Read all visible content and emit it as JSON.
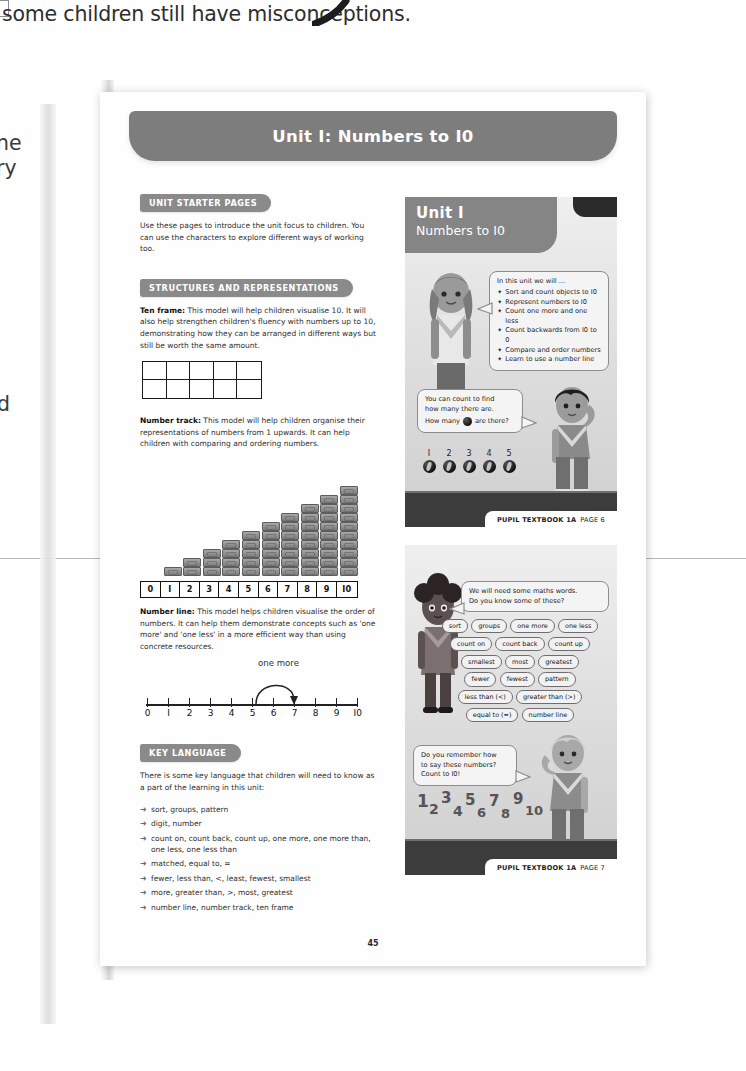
{
  "scan": {
    "facing_page_text": "some children still have misconceptions.",
    "left_margin_fragments": [
      "ne",
      "ry",
      "d"
    ]
  },
  "page": {
    "page_number": "45",
    "unit_banner_title": "Unit I: Numbers to I0"
  },
  "left_column": {
    "starter": {
      "heading": "UNIT STARTER PAGES",
      "body": "Use these pages to introduce the unit focus to children. You can use the characters to explore different ways of working too."
    },
    "structures": {
      "heading": "STRUCTURES AND REPRESENTATIONS",
      "ten_frame": {
        "label": "Ten frame:",
        "body": " This model will help children visualise 10. It will also help strengthen children's fluency with numbers up to 10, demonstrating how they can be arranged in different ways but still be worth the same amount.",
        "rows": 2,
        "cols": 5
      },
      "number_track": {
        "label": "Number track:",
        "body": " This model will help children organise their representations of numbers from 1 upwards. It can help children with comparing and ordering numbers.",
        "cells": [
          "0",
          "I",
          "2",
          "3",
          "4",
          "5",
          "6",
          "7",
          "8",
          "9",
          "I0"
        ],
        "stack_heights": [
          0,
          1,
          2,
          3,
          4,
          5,
          6,
          7,
          8,
          9,
          10
        ]
      },
      "number_line": {
        "label": "Number line:",
        "body": " This model helps children visualise the order of numbers. It can help them demonstrate concepts such as 'one more' and 'one less' in a more efficient way than using concrete resources.",
        "annotation": "one more",
        "ticks": [
          "0",
          "I",
          "2",
          "3",
          "4",
          "5",
          "6",
          "7",
          "8",
          "9",
          "I0"
        ],
        "arc_from": "6",
        "arc_to": "7"
      }
    },
    "key_language": {
      "heading": "KEY LANGUAGE",
      "intro": "There is some key language that children will need to know as a part of the learning in this unit:",
      "items": [
        "sort, groups, pattern",
        "digit, number",
        "count on, count back, count up, one more, one more than, one less, one less than",
        "matched, equal to, =",
        "fewer, less than, <, least, fewest, smallest",
        "more, greater than, >, most, greatest",
        "number line, number track, ten frame"
      ],
      "arrow_glyph": "➜"
    }
  },
  "right_column": {
    "page6": {
      "title_line1": "Unit I",
      "title_line2": "Numbers to I0",
      "bubble_intro": "In this unit we will ...",
      "bubble_items": [
        "Sort and count objects to I0",
        "Represent numbers to I0",
        "Count one more and one less",
        "Count backwards from I0 to 0",
        "Compare and order numbers",
        "Learn to use a number line"
      ],
      "bullet_glyph": "✦",
      "bubble2_line1": "You can count to find",
      "bubble2_line2": "how many there are.",
      "bubble2_line3_pre": "How many",
      "bubble2_line3_post": "are there?",
      "count_numbers": [
        "I",
        "2",
        "3",
        "4",
        "5"
      ],
      "footer_label": "PUPIL TEXTBOOK 1A",
      "footer_page": "PAGE 6"
    },
    "page7": {
      "bubble_line1": "We will need some maths words.",
      "bubble_line2": "Do you know some of these?",
      "tag_rows": [
        [
          "sort",
          "groups",
          "one more",
          "one less"
        ],
        [
          "count on",
          "count back",
          "count up"
        ],
        [
          "smallest",
          "most",
          "greatest"
        ],
        [
          "fewer",
          "fewest",
          "pattern"
        ],
        [
          "less than (<)",
          "greater than (>)"
        ],
        [
          "equal to (=)",
          "number line"
        ]
      ],
      "bubble2_line1": "Do you remember how",
      "bubble2_line2": "to say these numbers?",
      "bubble2_line3": "Count to I0!",
      "wavy_numbers": [
        "1",
        "2",
        "3",
        "4",
        "5",
        "6",
        "7",
        "8",
        "9",
        "10"
      ],
      "footer_label": "PUPIL TEXTBOOK 1A",
      "footer_page": "PAGE 7"
    }
  },
  "colors": {
    "banner_grey": "#7d7d7d",
    "pill_grey": "#8a8a8a",
    "textbook_bg": "#e0e0e0",
    "floor_dark": "#3c3c3c",
    "ink": "#2f2f2f"
  }
}
